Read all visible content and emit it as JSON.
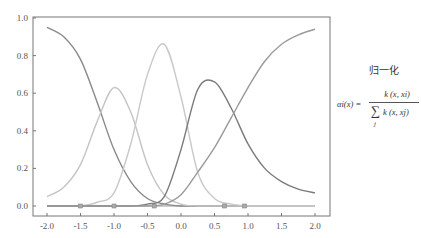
{
  "chart_data": {
    "type": "line",
    "title": "",
    "xlabel": "",
    "ylabel": "",
    "xlim": [
      -2.0,
      2.0
    ],
    "ylim": [
      0.0,
      1.0
    ],
    "grid": false,
    "x_ticks": [
      "-2.0",
      "-1.5",
      "-1.0",
      "-0.5",
      "0.0",
      "0.5",
      "1.0",
      "1.5",
      "2.0"
    ],
    "y_ticks": [
      "0.0",
      "0.2",
      "0.4",
      "0.6",
      "0.8",
      "1.0"
    ],
    "x": [
      -2.0,
      -1.75,
      -1.5,
      -1.25,
      -1.0,
      -0.75,
      -0.5,
      -0.25,
      0.0,
      0.25,
      0.5,
      0.75,
      1.0,
      1.25,
      1.5,
      1.75,
      2.0
    ],
    "series": [
      {
        "name": "k1 (center -1.5)",
        "color": "#8a8a8a",
        "values": [
          0.95,
          0.9,
          0.78,
          0.55,
          0.3,
          0.13,
          0.04,
          0.01,
          0.0,
          0.0,
          0.0,
          0.0,
          0.0,
          0.0,
          0.0,
          0.0,
          0.0
        ]
      },
      {
        "name": "k2 (center -1.0)",
        "color": "#c4c4c4",
        "values": [
          0.05,
          0.1,
          0.22,
          0.45,
          0.63,
          0.5,
          0.22,
          0.06,
          0.01,
          0.0,
          0.0,
          0.0,
          0.0,
          0.0,
          0.0,
          0.0,
          0.0
        ]
      },
      {
        "name": "k3 (center -0.4)",
        "color": "#c8c8c8",
        "values": [
          0.0,
          0.0,
          0.0,
          0.02,
          0.07,
          0.33,
          0.7,
          0.86,
          0.58,
          0.18,
          0.04,
          0.01,
          0.0,
          0.0,
          0.0,
          0.0,
          0.0
        ]
      },
      {
        "name": "k4 (center 0.65)",
        "color": "#7a7a7a",
        "values": [
          0.0,
          0.0,
          0.0,
          0.0,
          0.0,
          0.0,
          0.01,
          0.05,
          0.3,
          0.62,
          0.66,
          0.52,
          0.33,
          0.2,
          0.13,
          0.09,
          0.07
        ]
      },
      {
        "name": "k5 (center 0.95)",
        "color": "#9a9a9a",
        "values": [
          0.0,
          0.0,
          0.0,
          0.0,
          0.0,
          0.0,
          0.0,
          0.01,
          0.06,
          0.18,
          0.31,
          0.47,
          0.63,
          0.77,
          0.86,
          0.91,
          0.94
        ]
      }
    ],
    "data_points_x": [
      -1.5,
      -1.0,
      -0.4,
      0.65,
      0.95
    ],
    "annotations": []
  },
  "side_panel": {
    "title": "归一化",
    "formula": {
      "lhs": "αi(x) =",
      "numerator": "k (x, xi)",
      "sum_symbol": "∑",
      "denominator": "k (x, xj)",
      "sum_index": "j"
    }
  }
}
